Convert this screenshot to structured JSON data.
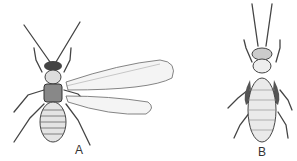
{
  "figure": {
    "panels": [
      {
        "id": "A",
        "label": "A",
        "description": "winged insect, dorsal view"
      },
      {
        "id": "B",
        "label": "B",
        "description": "wingless insect, dorsal view"
      }
    ],
    "colors": {
      "ink": "#333333",
      "shade": "#777777",
      "wing": "#f4f4f4",
      "background": "#ffffff"
    }
  }
}
